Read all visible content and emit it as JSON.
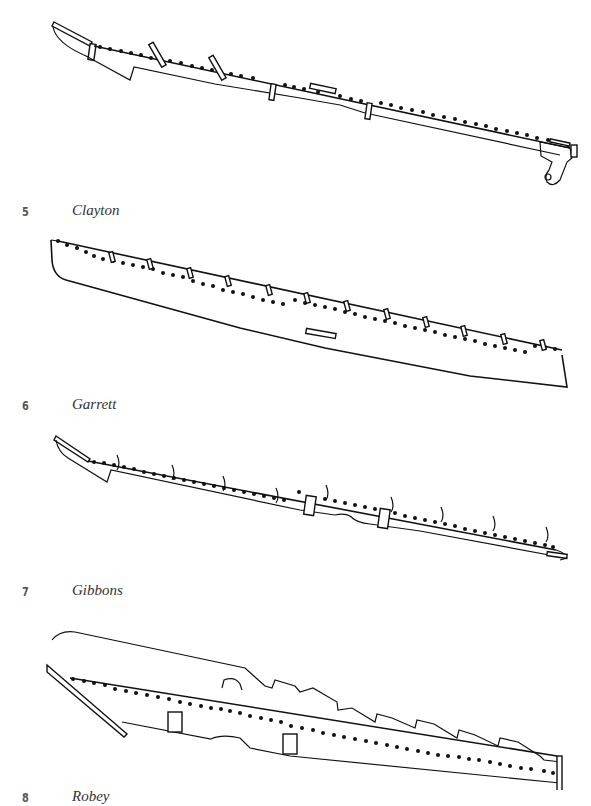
{
  "figures": [
    {
      "number": "5",
      "title": "Clayton",
      "subject": "knife-bar-drawing"
    },
    {
      "number": "6",
      "title": "Garrett",
      "subject": "knife-bar-drawing"
    },
    {
      "number": "7",
      "title": "Gibbons",
      "subject": "knife-bar-drawing"
    },
    {
      "number": "8",
      "title": "Robey",
      "subject": "knife-bar-drawing"
    }
  ],
  "colors": {
    "ink": "#111111",
    "caption_number": "#555555",
    "caption_text": "#333333",
    "paper": "#ffffff"
  }
}
